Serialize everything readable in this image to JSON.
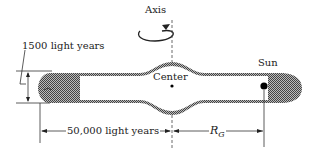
{
  "diagram": {
    "labels": {
      "axis": "Axis",
      "thickness": "1500 light years",
      "center": "Center",
      "sun": "Sun",
      "radius": "50,000 light years",
      "rg_main": "R",
      "rg_sub": "G"
    },
    "colors": {
      "line": "#333333",
      "hatch": "#555555",
      "background": "#ffffff"
    }
  }
}
